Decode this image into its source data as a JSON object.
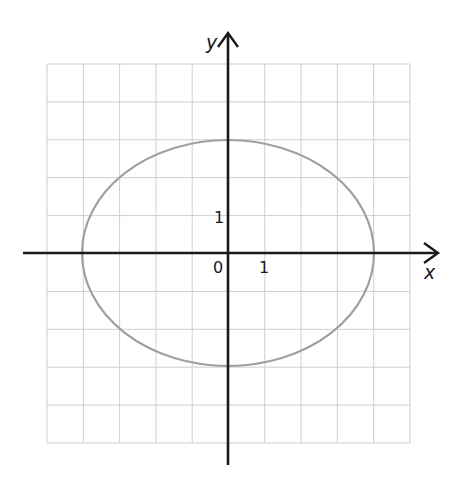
{
  "figure": {
    "x_axis_label": "x",
    "y_axis_label": "y",
    "origin_label": "0",
    "x_tick_label": "1",
    "y_tick_label": "1",
    "colors": {
      "grid": "#cfcfcf",
      "axis": "#1a1a1a",
      "curve": "#a0a0a0"
    }
  },
  "chart_data": {
    "type": "line",
    "title": "",
    "xlabel": "x",
    "ylabel": "y",
    "curve": "ellipse",
    "equation": "x^2/16 + y^2/9 = 1",
    "center": [
      0,
      0
    ],
    "semi_axis_x": 4,
    "semi_axis_y": 3,
    "xlim": [
      -5,
      5
    ],
    "ylim": [
      -5,
      5
    ],
    "grid": true,
    "labeled_ticks": {
      "x": [
        1
      ],
      "y": [
        1
      ]
    }
  }
}
